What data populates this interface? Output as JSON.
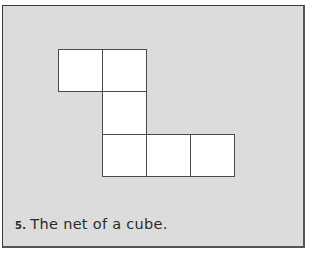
{
  "figure": {
    "number": "5.",
    "caption": "The net of a cube.",
    "frame_color": "#dcdcdc",
    "square_fill": "#ffffff",
    "line_color": "#4a4a4a",
    "net_squares": [
      {
        "id": "square-1",
        "row": 0,
        "col": 0,
        "x": 58,
        "y": 49
      },
      {
        "id": "square-2",
        "row": 0,
        "col": 1,
        "x": 102,
        "y": 49
      },
      {
        "id": "square-3",
        "row": 1,
        "col": 1,
        "x": 102,
        "y": 91
      },
      {
        "id": "square-4",
        "row": 2,
        "col": 1,
        "x": 102,
        "y": 134
      },
      {
        "id": "square-5",
        "row": 2,
        "col": 2,
        "x": 146,
        "y": 134
      },
      {
        "id": "square-6",
        "row": 2,
        "col": 3,
        "x": 190,
        "y": 134
      }
    ],
    "square_size": 44
  }
}
